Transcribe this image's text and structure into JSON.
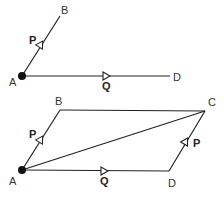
{
  "figure_top": {
    "points": {
      "A": {
        "label": "A",
        "x": 22,
        "y": 76
      },
      "B": {
        "label": "B",
        "x": 60,
        "y": 16
      },
      "D": {
        "label": "D",
        "x": 170,
        "y": 76
      }
    },
    "vectors": [
      {
        "name": "P",
        "from": "A",
        "to": "B"
      },
      {
        "name": "Q",
        "from": "A",
        "to": "D"
      }
    ]
  },
  "figure_bottom": {
    "points": {
      "A": {
        "label": "A",
        "x": 22,
        "y": 170
      },
      "B": {
        "label": "B",
        "x": 60,
        "y": 110
      },
      "C": {
        "label": "C",
        "x": 205,
        "y": 111
      },
      "D": {
        "label": "D",
        "x": 169,
        "y": 171
      }
    },
    "vectors": [
      {
        "name": "P",
        "from": "A",
        "to": "B"
      },
      {
        "name": "Q",
        "from": "A",
        "to": "D"
      },
      {
        "name": "P",
        "from": "D",
        "to": "C"
      }
    ],
    "diagonal": {
      "from": "A",
      "to": "C"
    }
  },
  "labels": {
    "top_A": "A",
    "top_B": "B",
    "top_D": "D",
    "top_P": "P",
    "top_Q": "Q",
    "bot_A": "A",
    "bot_B": "B",
    "bot_C": "C",
    "bot_D": "D",
    "bot_P_left": "P",
    "bot_P_right": "P",
    "bot_Q": "Q"
  }
}
